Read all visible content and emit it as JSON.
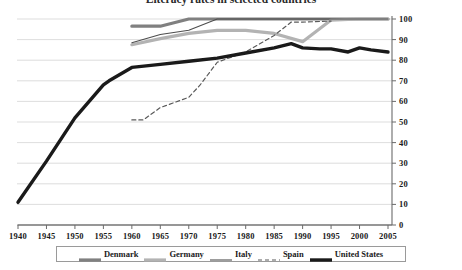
{
  "title": {
    "text": "Literacy rates in selected countries",
    "visible_clipped": true
  },
  "legend": {
    "items": [
      {
        "label": "Denmark",
        "color": "#808080",
        "width": 3.2,
        "dash": "none",
        "icon": "line-swatch-icon"
      },
      {
        "label": "Germany",
        "color": "#b3b3b3",
        "width": 3.2,
        "dash": "none",
        "icon": "line-swatch-icon"
      },
      {
        "label": "Italy",
        "color": "#4d4d4d",
        "width": 1.1,
        "dash": "none",
        "icon": "line-swatch-icon"
      },
      {
        "label": "Spain",
        "color": "#5a5a5a",
        "width": 1.2,
        "dash": "4,3",
        "icon": "dashed-line-swatch-icon"
      },
      {
        "label": "United States",
        "color": "#1a1a1a",
        "width": 3.4,
        "dash": "none",
        "icon": "line-swatch-icon"
      }
    ]
  },
  "chart_data": {
    "type": "line",
    "title": "Literacy rates in selected countries",
    "xlabel": "",
    "ylabel": "",
    "xlim": [
      1940,
      2005
    ],
    "ylim": [
      0,
      100
    ],
    "xticks": [
      1940,
      1945,
      1950,
      1955,
      1960,
      1965,
      1970,
      1975,
      1980,
      1985,
      1990,
      1995,
      2000,
      2005
    ],
    "yticks": [
      0,
      10,
      20,
      30,
      40,
      50,
      60,
      70,
      80,
      90,
      100
    ],
    "grid": true,
    "grid_axis": "y",
    "legend_position": "bottom",
    "y_axis_position": "right",
    "series": [
      {
        "name": "Denmark",
        "color": "#808080",
        "line_width": 3.2,
        "dash": "none",
        "x": [
          1960,
          1965,
          1970,
          1975,
          1980,
          1985,
          1990,
          1995,
          2000,
          2005
        ],
        "y": [
          96.5,
          96.5,
          100,
          100,
          100,
          100,
          100,
          100,
          100,
          100
        ]
      },
      {
        "name": "Germany",
        "color": "#b3b3b3",
        "line_width": 3.2,
        "dash": "none",
        "x": [
          1960,
          1965,
          1970,
          1975,
          1980,
          1985,
          1990,
          1995,
          2000,
          2005
        ],
        "y": [
          87.5,
          90.5,
          93,
          94.5,
          94.5,
          93,
          89,
          99.5,
          100,
          100
        ]
      },
      {
        "name": "Italy",
        "color": "#4d4d4d",
        "line_width": 1.1,
        "dash": "none",
        "x": [
          1960,
          1965,
          1970,
          1975,
          1980,
          1985,
          1990,
          1995,
          2000,
          2005
        ],
        "y": [
          88.5,
          92.5,
          94.5,
          100,
          100,
          100,
          100,
          100,
          100,
          100
        ]
      },
      {
        "name": "Spain",
        "color": "#5a5a5a",
        "line_width": 1.2,
        "dash": "4,3",
        "x": [
          1960,
          1962,
          1965,
          1970,
          1972,
          1975,
          1980,
          1985,
          1988,
          1990,
          1995
        ],
        "y": [
          51,
          51,
          57,
          62,
          68,
          79,
          84,
          92,
          98.5,
          98.5,
          99
        ]
      },
      {
        "name": "United States",
        "color": "#1a1a1a",
        "line_width": 3.4,
        "dash": "none",
        "x": [
          1940,
          1945,
          1950,
          1955,
          1956,
          1960,
          1965,
          1970,
          1975,
          1980,
          1985,
          1988,
          1990,
          1993,
          1995,
          1998,
          2000,
          2002,
          2005
        ],
        "y": [
          11,
          31,
          52,
          68,
          70,
          76.5,
          78,
          79.5,
          81,
          83.5,
          86,
          88,
          86,
          85.5,
          85.5,
          84,
          86,
          85,
          84
        ]
      }
    ]
  }
}
